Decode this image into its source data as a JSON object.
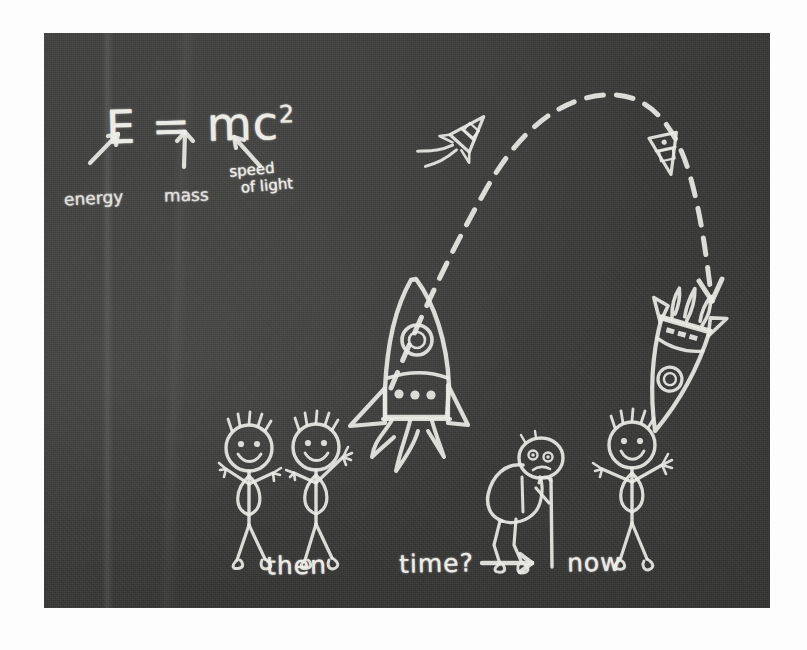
{
  "scene": {
    "medium": "chalkboard",
    "board_color": "#3a3a38",
    "chalk_color": "#e9e9e4",
    "background_color": "#ffffff"
  },
  "equation": {
    "base": "E = mc",
    "exponent": "2",
    "full": "E = mc2"
  },
  "annotations": {
    "energy_label": "energy",
    "mass_label": "mass",
    "speed_line1": "speed",
    "speed_line2": "of light"
  },
  "captions": {
    "then": "then",
    "time": "time?",
    "now": "now"
  },
  "figures": [
    {
      "name": "child-left",
      "caption_group": "then",
      "pose": "waving-happy",
      "age": "young"
    },
    {
      "name": "child-right",
      "caption_group": "then",
      "pose": "waving-happy",
      "age": "young"
    },
    {
      "name": "old-person",
      "caption_group": "time",
      "pose": "hunched-with-cane",
      "age": "old"
    },
    {
      "name": "young-person",
      "caption_group": "now",
      "pose": "waving-happy",
      "age": "young"
    }
  ],
  "rockets": [
    {
      "name": "launching-rocket",
      "state": "ascending-with-flames"
    },
    {
      "name": "small-rocket-ascending",
      "state": "in-flight"
    },
    {
      "name": "small-rocket-descending",
      "state": "in-flight"
    },
    {
      "name": "landing-rocket",
      "state": "descending-with-retro-thrust"
    }
  ],
  "trajectory": {
    "name": "dashed-arc",
    "style": "dashed",
    "direction": "left-to-right-arc-down"
  },
  "icons": {
    "arrow_energy": "arrow-up-right-icon",
    "arrow_mass": "arrow-up-icon",
    "arrow_speed": "arrow-up-left-icon",
    "arrow_time": "arrow-right-icon",
    "arrow_descent": "arrow-down-icon"
  }
}
